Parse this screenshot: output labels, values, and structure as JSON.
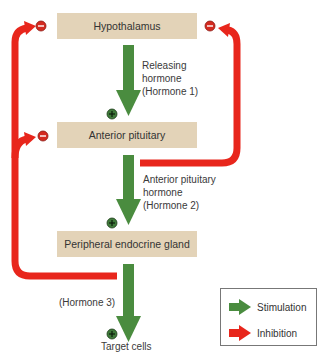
{
  "diagram": {
    "nodes": {
      "hypothalamus": "Hypothalamus",
      "anterior_pituitary": "Anterior pituitary",
      "peripheral_gland": "Peripheral endocrine gland",
      "target_cells": "Target cells"
    },
    "hormone_labels": {
      "hormone1": [
        "Releasing",
        "hormone",
        "(Hormone 1)"
      ],
      "hormone2": [
        "Anterior pituitary",
        "hormone",
        "(Hormone 2)"
      ],
      "hormone3": "(Hormone 3)"
    },
    "signs": {
      "plus": "+",
      "minus": "−"
    },
    "legend": {
      "stimulation": "Stimulation",
      "inhibition": "Inhibition"
    },
    "colors": {
      "stimulation": "#4a8c3f",
      "inhibition": "#e8261c",
      "box_fill": "#e3d3b8",
      "plus_badge": "#3f7a3a",
      "minus_badge": "#d42a20"
    }
  }
}
